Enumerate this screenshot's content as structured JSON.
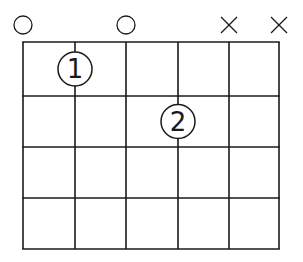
{
  "diagram": {
    "type": "chord-diagram",
    "strings": 6,
    "frets": 4,
    "string_x": [
      23,
      75,
      126,
      178,
      229,
      279
    ],
    "fret_y": [
      42,
      96,
      147,
      198,
      249
    ],
    "line_color": "#1a1a1a",
    "background": "#ffffff",
    "top_markers": [
      {
        "string": 1,
        "type": "open",
        "symbol": "O"
      },
      {
        "string": 2,
        "type": "none",
        "symbol": ""
      },
      {
        "string": 3,
        "type": "open",
        "symbol": "O"
      },
      {
        "string": 4,
        "type": "none",
        "symbol": ""
      },
      {
        "string": 5,
        "type": "muted",
        "symbol": "X"
      },
      {
        "string": 6,
        "type": "muted",
        "symbol": "X"
      }
    ],
    "fingers": [
      {
        "string": 2,
        "fret": 1,
        "label": "1"
      },
      {
        "string": 4,
        "fret": 2,
        "label": "2"
      }
    ]
  }
}
